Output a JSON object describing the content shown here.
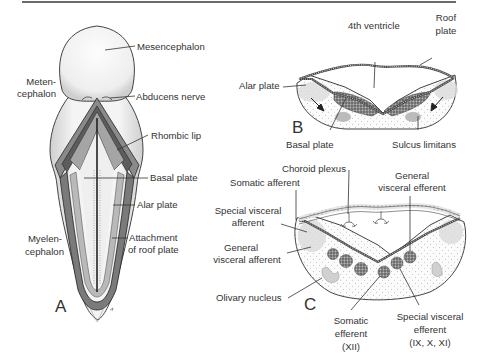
{
  "figure": {
    "panels": {
      "A": {
        "letter": "A",
        "labels": {
          "mesencephalon": "Mesencephalon",
          "metencephalon_1": "Meten-",
          "metencephalon_2": "cephalon",
          "abducens": "Abducens nerve",
          "rhombic_lip": "Rhombic lip",
          "basal_plate": "Basal plate",
          "alar_plate": "Alar plate",
          "attachment_1": "Attachment",
          "attachment_2": "of roof plate",
          "myelencephalon_1": "Myelen-",
          "myelencephalon_2": "cephalon"
        }
      },
      "B": {
        "letter": "B",
        "labels": {
          "fourth_ventricle": "4th ventricle",
          "roof_plate_1": "Roof",
          "roof_plate_2": "plate",
          "alar_plate": "Alar plate",
          "basal_plate": "Basal plate",
          "sulcus_limitans": "Sulcus limitans"
        }
      },
      "C": {
        "letter": "C",
        "labels": {
          "choroid_plexus": "Choroid plexus",
          "somatic_afferent": "Somatic afferent",
          "special_visceral_afferent_1": "Special visceral",
          "special_visceral_afferent_2": "afferent",
          "general_visceral_afferent_1": "General",
          "general_visceral_afferent_2": "visceral afferent",
          "olivary_nucleus": "Olivary nucleus",
          "general_visceral_efferent_1": "General",
          "general_visceral_efferent_2": "visceral efferent",
          "somatic_efferent_1": "Somatic",
          "somatic_efferent_2": "efferent",
          "somatic_efferent_3": "(XII)",
          "special_visceral_efferent_1": "Special visceral",
          "special_visceral_efferent_2": "efferent",
          "special_visceral_efferent_3": "(IX, X, XI)"
        }
      }
    },
    "colors": {
      "outline": "#3a3a3a",
      "shade_dark": "#6e6e6e",
      "shade_mid": "#a8a8a8",
      "shade_light": "#d6d6d6",
      "background": "#ffffff"
    }
  }
}
